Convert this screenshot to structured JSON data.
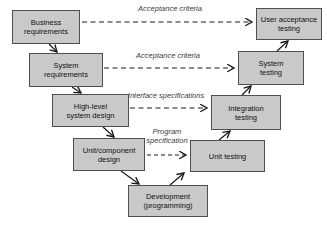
{
  "diagram": {
    "boxes": [
      {
        "id": "business-requirements",
        "label": "Business\nrequirements"
      },
      {
        "id": "system-requirements",
        "label": "System\nrequirements"
      },
      {
        "id": "high-level-system-design",
        "label": "High-level\nsystem design"
      },
      {
        "id": "unit-component-design",
        "label": "Unit/component\ndesign"
      },
      {
        "id": "development-programming",
        "label": "Development\n(programming)"
      },
      {
        "id": "unit-testing",
        "label": "Unit testing"
      },
      {
        "id": "integration-testing",
        "label": "Integration\ntesting"
      },
      {
        "id": "system-testing",
        "label": "System\ntesting"
      },
      {
        "id": "user-acceptance-testing",
        "label": "User acceptance\ntesting"
      }
    ],
    "connector_labels": [
      {
        "id": "acceptance-criteria-top",
        "label": "Acceptance criteria"
      },
      {
        "id": "acceptance-criteria-second",
        "label": "Acceptance criteria"
      },
      {
        "id": "interface-specifications",
        "label": "Interface specifications"
      },
      {
        "id": "program-specification",
        "label": "Program\nspecification"
      }
    ],
    "colors": {
      "box_fill": "#c9c9c9",
      "box_border": "#4f4f4f",
      "arrow": "#1a1a1a",
      "label_text": "#3d3d3d",
      "background": "#ffffff"
    }
  }
}
